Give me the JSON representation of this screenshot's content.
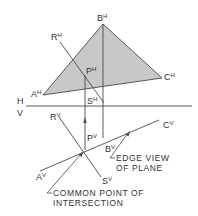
{
  "diagram": {
    "colors": {
      "line": "#4a4a4a",
      "fill": "#c8c8c8",
      "text": "#333333"
    },
    "reference_line": {
      "upper_label": "H",
      "lower_label": "V"
    },
    "points": {
      "A_H": {
        "base": "A",
        "sup": "H"
      },
      "B_H": {
        "base": "B",
        "sup": "H"
      },
      "C_H": {
        "base": "C",
        "sup": "H"
      },
      "R_H": {
        "base": "R",
        "sup": "H"
      },
      "S_H": {
        "base": "S",
        "sup": "H"
      },
      "P_H": {
        "base": "P",
        "sup": "H"
      },
      "A_V": {
        "base": "A",
        "sup": "V"
      },
      "B_V": {
        "base": "B",
        "sup": "V"
      },
      "C_V": {
        "base": "C",
        "sup": "V"
      },
      "R_V": {
        "base": "R",
        "sup": "V"
      },
      "S_V": {
        "base": "S",
        "sup": "V"
      },
      "P_V": {
        "base": "P",
        "sup": "V"
      }
    },
    "annotations": {
      "edge_view": {
        "line1": "EDGE VIEW",
        "line2": "OF PLANE"
      },
      "common_point": {
        "line1": "COMMON POINT OF",
        "line2": "INTERSECTION"
      }
    }
  }
}
